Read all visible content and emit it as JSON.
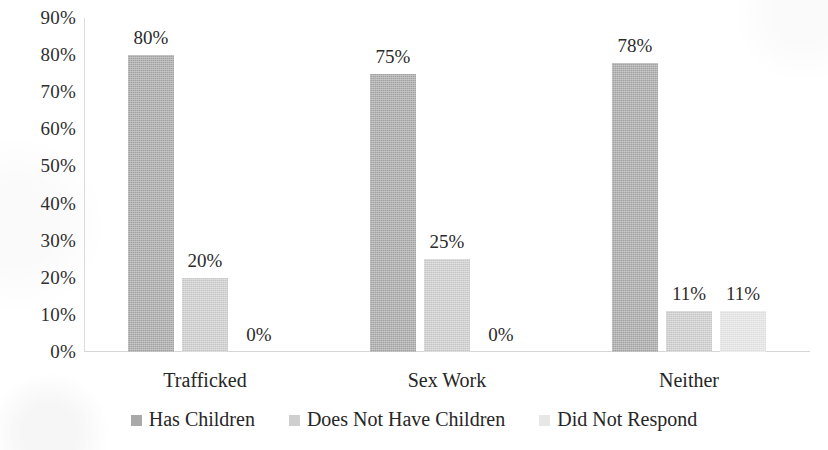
{
  "chart_data": {
    "type": "bar",
    "title": "",
    "subtitle": "",
    "xlabel": "",
    "ylabel": "",
    "categories": [
      "Trafficked",
      "Sex Work",
      "Neither"
    ],
    "series": [
      {
        "name": "Has Children",
        "color": "#a9a9a9",
        "values": [
          80,
          75,
          78
        ],
        "labels": [
          "80%",
          "75%",
          "78%"
        ]
      },
      {
        "name": "Does Not Have Children",
        "color": "#cfcfcf",
        "values": [
          20,
          25,
          11
        ],
        "labels": [
          "20%",
          "25%",
          "11%"
        ]
      },
      {
        "name": "Did Not Respond",
        "color": "#e7e7e7",
        "values": [
          0,
          0,
          11
        ],
        "labels": [
          "0%",
          "0%",
          "11%"
        ]
      }
    ],
    "ylim": [
      0,
      90
    ],
    "y_ticks": [
      90,
      80,
      70,
      60,
      50,
      40,
      30,
      20,
      10,
      0
    ],
    "y_tick_labels": [
      "90%",
      "80%",
      "70%",
      "60%",
      "50%",
      "40%",
      "30%",
      "20%",
      "10%",
      "0%"
    ],
    "grid": false,
    "legend_position": "bottom",
    "value_labels": true
  }
}
